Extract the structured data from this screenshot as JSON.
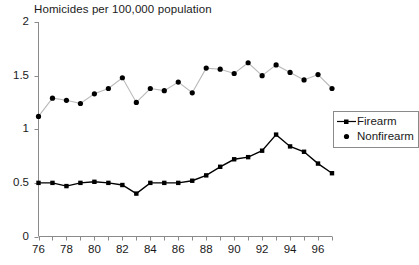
{
  "chart_data": {
    "type": "line",
    "title": "Homicides per 100,000 population",
    "xlabel": "",
    "ylabel": "",
    "ylim": [
      0,
      2
    ],
    "yticks": [
      0,
      0.5,
      1,
      1.5,
      2
    ],
    "ytick_labels": [
      "0",
      "0.5",
      "1",
      "1.5",
      "2"
    ],
    "xlim": [
      76,
      97
    ],
    "xticks": [
      76,
      77,
      78,
      79,
      80,
      81,
      82,
      83,
      84,
      85,
      86,
      87,
      88,
      89,
      90,
      91,
      92,
      93,
      94,
      95,
      96,
      97
    ],
    "xtick_labels": [
      "76",
      "",
      "78",
      "",
      "80",
      "",
      "82",
      "",
      "84",
      "",
      "86",
      "",
      "88",
      "",
      "90",
      "",
      "92",
      "",
      "94",
      "",
      "96",
      ""
    ],
    "x": [
      76,
      77,
      78,
      79,
      80,
      81,
      82,
      83,
      84,
      85,
      86,
      87,
      88,
      89,
      90,
      91,
      92,
      93,
      94,
      95,
      96,
      97
    ],
    "grid": false,
    "legend_position": "right-middle",
    "series": [
      {
        "name": "Firearm",
        "marker": "square",
        "color": "#000000",
        "values": [
          0.5,
          0.5,
          0.47,
          0.5,
          0.51,
          0.5,
          0.48,
          0.4,
          0.5,
          0.5,
          0.5,
          0.52,
          0.57,
          0.65,
          0.72,
          0.74,
          0.8,
          0.95,
          0.84,
          0.79,
          0.68,
          0.59
        ]
      },
      {
        "name": "Nonfirearm",
        "marker": "circle",
        "color": "#000000",
        "values": [
          1.12,
          1.29,
          1.27,
          1.24,
          1.33,
          1.38,
          1.48,
          1.25,
          1.38,
          1.36,
          1.44,
          1.34,
          1.57,
          1.56,
          1.52,
          1.62,
          1.5,
          1.6,
          1.53,
          1.46,
          1.51,
          1.38
        ]
      }
    ]
  },
  "legend": {
    "items": [
      {
        "label": "Firearm"
      },
      {
        "label": "Nonfirearm"
      }
    ]
  }
}
